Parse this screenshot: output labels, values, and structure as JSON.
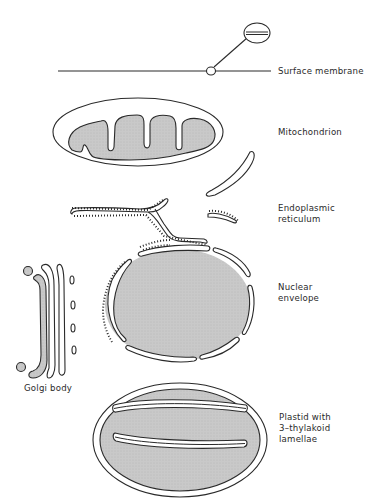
{
  "figure": {
    "type": "labelled organelle membrane diagram",
    "colors": {
      "outline": "#2a2a2a",
      "matrix_fill": "#c6c6c6",
      "background": "#ffffff"
    }
  },
  "labels": {
    "surface_membrane": "Surface membrane",
    "mitochondrion": "Mitochondrion",
    "endoplasmic_reticulum": [
      "Endoplasmic",
      "reticulum"
    ],
    "nuclear_envelope": [
      "Nuclear",
      "envelope"
    ],
    "golgi_body": "Golgi body",
    "plastid": [
      "Plastid with",
      "3–thylakoid",
      "lamellae"
    ]
  }
}
